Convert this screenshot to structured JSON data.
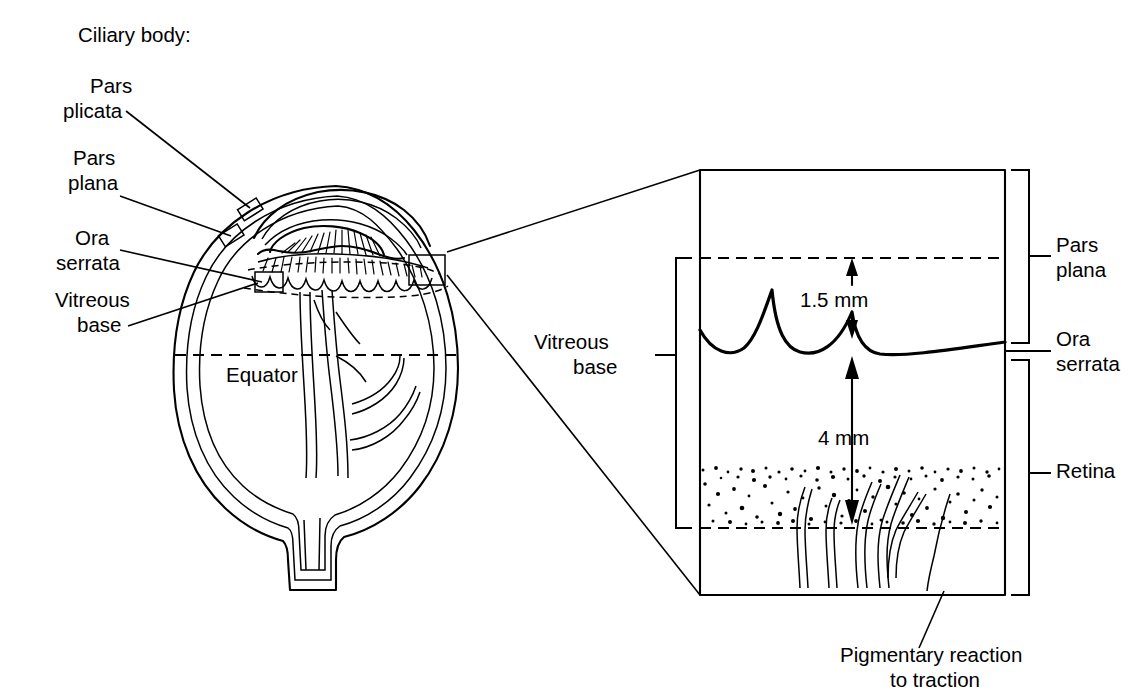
{
  "figure": {
    "background_color": "#ffffff",
    "ink_color": "#000000",
    "width": 1145,
    "height": 696
  },
  "left_panel": {
    "name": "sagittal-eye-cross-section",
    "labels": {
      "ciliary_body_heading": "Ciliary body:",
      "pars_plicata": "Pars\nplicata",
      "pars_plicata_line1": "Pars",
      "pars_plicata_line2": "plicata",
      "pars_plana_line1": "Pars",
      "pars_plana_line2": "plana",
      "ora_serrata_line1": "Ora",
      "ora_serrata_line2": "serrata",
      "vitreous_base_line1": "Vitreous",
      "vitreous_base_line2": "base",
      "equator": "Equator"
    },
    "callout_boxes": [
      {
        "name": "ora-serrata-box-left",
        "x": 255,
        "y": 272,
        "w": 28,
        "h": 20
      },
      {
        "name": "ora-serrata-box-right",
        "x": 409,
        "y": 255,
        "w": 36,
        "h": 30
      }
    ]
  },
  "inset_panel": {
    "name": "magnified-vitreous-base-inset",
    "frame": {
      "left": 700,
      "top": 170,
      "right": 1005,
      "bottom": 595
    },
    "measurements": [
      {
        "name": "pars-plana-width",
        "value": "1.5 mm"
      },
      {
        "name": "retina-traction-depth",
        "value": "4 mm"
      }
    ],
    "right_labels": [
      {
        "name": "pars-plana",
        "line1": "Pars",
        "line2": "plana"
      },
      {
        "name": "ora-serrata",
        "line1": "Ora",
        "line2": "serrata"
      },
      {
        "name": "retina",
        "line1": "Retina",
        "line2": ""
      }
    ],
    "left_labels": [
      {
        "name": "vitreous-base",
        "line1": "Vitreous",
        "line2": "base"
      }
    ],
    "bottom_label": {
      "name": "pigmentary-reaction",
      "line1": "Pigmentary reaction",
      "line2": "to traction"
    }
  }
}
